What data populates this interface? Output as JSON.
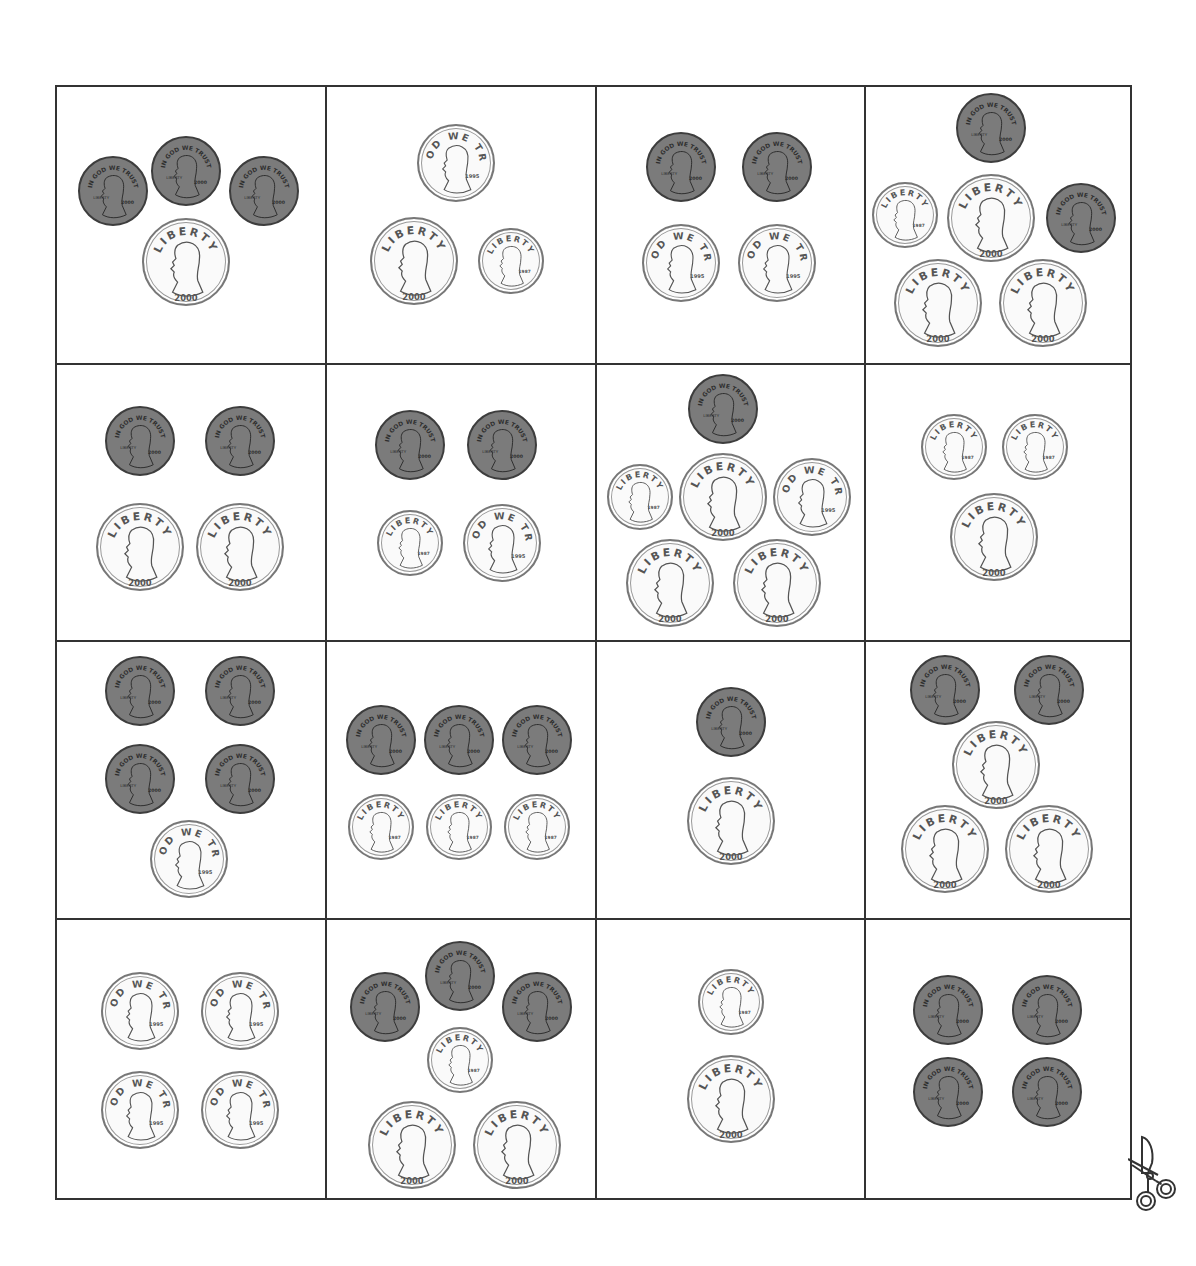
{
  "worksheet": {
    "type": "coin counting cut-out cards",
    "rows": 4,
    "cols": 4,
    "grid_bounds": {
      "left": 55,
      "top": 85,
      "right": 1130,
      "bottom": 1198
    },
    "col_edges": [
      55,
      325,
      595,
      864,
      1130
    ],
    "row_edges": [
      85,
      363,
      640,
      918,
      1198
    ],
    "coin_sizes": {
      "penny": 70,
      "nickel": 78,
      "dime": 66,
      "quarter": 88
    },
    "coin_labels": {
      "penny": {
        "motto": "IN GOD WE TRUST",
        "word": "LIBERTY",
        "year": "2000"
      },
      "nickel": {
        "motto": "IN GOD WE TRUST",
        "word": "LIBERTY",
        "year": "1995"
      },
      "dime": {
        "word": "LIBERTY",
        "year": "1987"
      },
      "quarter": {
        "word": "LIBERTY",
        "year": "2000"
      }
    },
    "colors": {
      "penny_fill": "#7b7b7b",
      "silver_fill": "#fafafa",
      "border": "#333333"
    },
    "cards": [
      {
        "row": 0,
        "col": 0,
        "coins": [
          {
            "t": "penny",
            "x": 113,
            "y": 191
          },
          {
            "t": "penny",
            "x": 186,
            "y": 171
          },
          {
            "t": "penny",
            "x": 264,
            "y": 191
          },
          {
            "t": "quarter",
            "x": 186,
            "y": 262
          }
        ]
      },
      {
        "row": 0,
        "col": 1,
        "coins": [
          {
            "t": "nickel",
            "x": 456,
            "y": 163
          },
          {
            "t": "quarter",
            "x": 414,
            "y": 261
          },
          {
            "t": "dime",
            "x": 511,
            "y": 261
          }
        ]
      },
      {
        "row": 0,
        "col": 2,
        "coins": [
          {
            "t": "penny",
            "x": 681,
            "y": 167
          },
          {
            "t": "penny",
            "x": 777,
            "y": 167
          },
          {
            "t": "nickel",
            "x": 681,
            "y": 263
          },
          {
            "t": "nickel",
            "x": 777,
            "y": 263
          }
        ]
      },
      {
        "row": 0,
        "col": 3,
        "coins": [
          {
            "t": "penny",
            "x": 991,
            "y": 128
          },
          {
            "t": "dime",
            "x": 905,
            "y": 215
          },
          {
            "t": "quarter",
            "x": 991,
            "y": 218
          },
          {
            "t": "penny",
            "x": 1081,
            "y": 218
          },
          {
            "t": "quarter",
            "x": 938,
            "y": 303
          },
          {
            "t": "quarter",
            "x": 1043,
            "y": 303
          }
        ]
      },
      {
        "row": 1,
        "col": 0,
        "coins": [
          {
            "t": "penny",
            "x": 140,
            "y": 441
          },
          {
            "t": "penny",
            "x": 240,
            "y": 441
          },
          {
            "t": "quarter",
            "x": 140,
            "y": 547
          },
          {
            "t": "quarter",
            "x": 240,
            "y": 547
          }
        ]
      },
      {
        "row": 1,
        "col": 1,
        "coins": [
          {
            "t": "penny",
            "x": 410,
            "y": 445
          },
          {
            "t": "penny",
            "x": 502,
            "y": 445
          },
          {
            "t": "dime",
            "x": 410,
            "y": 543
          },
          {
            "t": "nickel",
            "x": 502,
            "y": 543
          }
        ]
      },
      {
        "row": 1,
        "col": 2,
        "coins": [
          {
            "t": "penny",
            "x": 723,
            "y": 409
          },
          {
            "t": "dime",
            "x": 640,
            "y": 497
          },
          {
            "t": "quarter",
            "x": 723,
            "y": 497
          },
          {
            "t": "nickel",
            "x": 812,
            "y": 497
          },
          {
            "t": "quarter",
            "x": 670,
            "y": 583
          },
          {
            "t": "quarter",
            "x": 777,
            "y": 583
          }
        ]
      },
      {
        "row": 1,
        "col": 3,
        "coins": [
          {
            "t": "dime",
            "x": 954,
            "y": 447
          },
          {
            "t": "dime",
            "x": 1035,
            "y": 447
          },
          {
            "t": "quarter",
            "x": 994,
            "y": 537
          }
        ]
      },
      {
        "row": 2,
        "col": 0,
        "coins": [
          {
            "t": "penny",
            "x": 140,
            "y": 691
          },
          {
            "t": "penny",
            "x": 240,
            "y": 691
          },
          {
            "t": "penny",
            "x": 140,
            "y": 779
          },
          {
            "t": "penny",
            "x": 240,
            "y": 779
          },
          {
            "t": "nickel",
            "x": 189,
            "y": 859
          }
        ]
      },
      {
        "row": 2,
        "col": 1,
        "coins": [
          {
            "t": "penny",
            "x": 381,
            "y": 740
          },
          {
            "t": "penny",
            "x": 459,
            "y": 740
          },
          {
            "t": "penny",
            "x": 537,
            "y": 740
          },
          {
            "t": "dime",
            "x": 381,
            "y": 827
          },
          {
            "t": "dime",
            "x": 459,
            "y": 827
          },
          {
            "t": "dime",
            "x": 537,
            "y": 827
          }
        ]
      },
      {
        "row": 2,
        "col": 2,
        "coins": [
          {
            "t": "penny",
            "x": 731,
            "y": 722
          },
          {
            "t": "quarter",
            "x": 731,
            "y": 821
          }
        ]
      },
      {
        "row": 2,
        "col": 3,
        "coins": [
          {
            "t": "penny",
            "x": 945,
            "y": 690
          },
          {
            "t": "penny",
            "x": 1049,
            "y": 690
          },
          {
            "t": "quarter",
            "x": 996,
            "y": 765
          },
          {
            "t": "quarter",
            "x": 945,
            "y": 849
          },
          {
            "t": "quarter",
            "x": 1049,
            "y": 849
          }
        ]
      },
      {
        "row": 3,
        "col": 0,
        "coins": [
          {
            "t": "nickel",
            "x": 140,
            "y": 1011
          },
          {
            "t": "nickel",
            "x": 240,
            "y": 1011
          },
          {
            "t": "nickel",
            "x": 140,
            "y": 1110
          },
          {
            "t": "nickel",
            "x": 240,
            "y": 1110
          }
        ]
      },
      {
        "row": 3,
        "col": 1,
        "coins": [
          {
            "t": "penny",
            "x": 385,
            "y": 1007
          },
          {
            "t": "penny",
            "x": 460,
            "y": 976
          },
          {
            "t": "penny",
            "x": 537,
            "y": 1007
          },
          {
            "t": "dime",
            "x": 460,
            "y": 1060
          },
          {
            "t": "quarter",
            "x": 412,
            "y": 1145
          },
          {
            "t": "quarter",
            "x": 517,
            "y": 1145
          }
        ]
      },
      {
        "row": 3,
        "col": 2,
        "coins": [
          {
            "t": "dime",
            "x": 731,
            "y": 1002
          },
          {
            "t": "quarter",
            "x": 731,
            "y": 1099
          }
        ]
      },
      {
        "row": 3,
        "col": 3,
        "coins": [
          {
            "t": "penny",
            "x": 948,
            "y": 1010
          },
          {
            "t": "penny",
            "x": 1047,
            "y": 1010
          },
          {
            "t": "penny",
            "x": 948,
            "y": 1092
          },
          {
            "t": "penny",
            "x": 1047,
            "y": 1092
          }
        ]
      }
    ]
  },
  "scissors": {
    "icon": "scissors-icon",
    "x": 1128,
    "y": 1133
  }
}
